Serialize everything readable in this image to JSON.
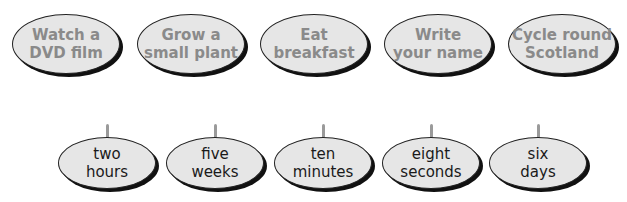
{
  "top_row": {
    "activities": [
      {
        "line1": "Watch a",
        "line2": "DVD film"
      },
      {
        "line1": "Grow a",
        "line2": "small plant"
      },
      {
        "line1": "Eat",
        "line2": "breakfast"
      },
      {
        "line1": "Write",
        "line2": "your name"
      },
      {
        "line1": "Cycle round",
        "line2": "Scotland"
      }
    ]
  },
  "bottom_row": {
    "durations": [
      {
        "line1": "two",
        "line2": "hours"
      },
      {
        "line1": "five",
        "line2": "weeks"
      },
      {
        "line1": "ten",
        "line2": "minutes"
      },
      {
        "line1": "eight",
        "line2": "seconds"
      },
      {
        "line1": "six",
        "line2": "days"
      }
    ]
  },
  "colors": {
    "oval_fill": "#e6e6e6",
    "oval_border": "#222222",
    "activity_text": "#8a8a8a",
    "duration_text": "#1a1a1a",
    "stem": "#9a9a9a"
  }
}
